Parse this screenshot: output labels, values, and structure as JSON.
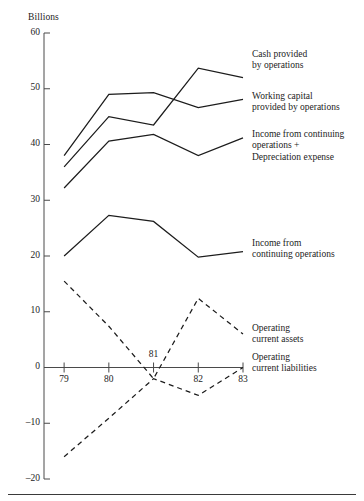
{
  "figure": {
    "name": "cash-flow-trend-chart",
    "y_axis_title": "Billions",
    "background_color": "#ffffff",
    "line_color": "#1c1c1c",
    "axis_color": "#4a4a4a"
  },
  "chart_data": {
    "type": "line",
    "title": "",
    "subtitle": "",
    "xlabel": "",
    "ylabel": "Billions",
    "x": [
      79,
      80,
      81,
      82,
      83
    ],
    "categories": [
      "79",
      "80",
      "81",
      "82",
      "83"
    ],
    "xtick_labels": [
      "79",
      "80",
      "81",
      "82",
      "83"
    ],
    "ytick_labels": [
      "60",
      "50",
      "40",
      "30",
      "20",
      "10",
      "0",
      "–10",
      "–20"
    ],
    "ytick_values": [
      60,
      50,
      40,
      30,
      20,
      10,
      0,
      -10,
      -20
    ],
    "xlim": [
      78.55,
      83.0
    ],
    "ylim": [
      -20,
      60
    ],
    "grid": false,
    "legend_position": "right-inline-labels",
    "series": [
      {
        "name": "Cash provided by operations",
        "label": "Cash provided\nby operations",
        "style": "solid",
        "values": [
          36.0,
          45.0,
          43.5,
          53.7,
          52.0
        ]
      },
      {
        "name": "Working capital provided by operations",
        "label": "Working capital\nprovided by operations",
        "style": "solid",
        "values": [
          38.0,
          49.0,
          49.3,
          46.6,
          48.1
        ]
      },
      {
        "name": "Income from continuing operations + Depreciation expense",
        "label": "Income from continuing\noperations +\nDepreciation expense",
        "style": "solid",
        "values": [
          32.2,
          40.6,
          41.8,
          38.0,
          41.2
        ]
      },
      {
        "name": "Income from continuing operations",
        "label": "Income from\ncontinuing operations",
        "style": "solid",
        "values": [
          20.0,
          27.3,
          26.2,
          19.8,
          20.8
        ]
      },
      {
        "name": "Operating current assets",
        "label": "Operating\ncurrent assets",
        "style": "dashed",
        "values": [
          15.5,
          7.4,
          -2.0,
          12.4,
          6.0
        ]
      },
      {
        "name": "Operating current liabilities",
        "label": "Operating\ncurrent liabilities",
        "style": "dashed",
        "values": [
          -16.0,
          -9.1,
          -2.0,
          -5.0,
          0.0
        ]
      }
    ]
  },
  "series_labels": [
    {
      "key": "cash-provided-by-operations",
      "lines": [
        "Cash provided",
        "by operations"
      ],
      "x": 252,
      "y": 49
    },
    {
      "key": "working-capital-provided-by-operations",
      "lines": [
        "Working capital",
        "provided by operations"
      ],
      "x": 252,
      "y": 91
    },
    {
      "key": "income-continuing-operations-plus-depreciation",
      "lines": [
        "Income from continuing",
        "operations +",
        "Depreciation expense"
      ],
      "x": 252,
      "y": 129
    },
    {
      "key": "income-from-continuing-operations",
      "lines": [
        "Income from",
        "continuing operations"
      ],
      "x": 252,
      "y": 238
    },
    {
      "key": "operating-current-assets",
      "lines": [
        "Operating",
        "current assets"
      ],
      "x": 252,
      "y": 323
    },
    {
      "key": "operating-current-liabilities",
      "lines": [
        "Operating",
        "current liabilities"
      ],
      "x": 252,
      "y": 352
    }
  ]
}
